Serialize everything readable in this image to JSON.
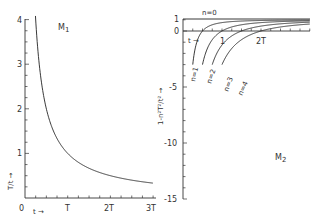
{
  "chart_data": [
    {
      "type": "line",
      "panel_label": "M₁",
      "ylabel": "T/t →",
      "xlabel": "t →",
      "x_ticks": [
        "0",
        "T",
        "2T",
        "3T"
      ],
      "y_ticks": [
        "1",
        "2",
        "3",
        "4"
      ],
      "xlim": [
        0,
        3
      ],
      "ylim": [
        0,
        4
      ],
      "grid": false,
      "series": [
        {
          "name": "T/t",
          "x_unit": "T",
          "x": [
            0.25,
            0.3,
            0.4,
            0.5,
            0.75,
            1.0,
            1.5,
            2.0,
            2.5,
            3.0
          ],
          "values": [
            4.0,
            3.33,
            2.5,
            2.0,
            1.33,
            1.0,
            0.67,
            0.5,
            0.4,
            0.33
          ]
        }
      ]
    },
    {
      "type": "line",
      "panel_label": "M₂",
      "ylabel": "1 - n²T²/t² →",
      "xlabel": "t →",
      "x_ticks": [
        "1",
        "2T"
      ],
      "y_ticks": [
        "1",
        "0",
        "-5",
        "-10",
        "-15"
      ],
      "xlim": [
        0,
        3.5
      ],
      "ylim": [
        -15,
        1
      ],
      "grid": false,
      "series": [
        {
          "name": "n=0",
          "label": "n=0",
          "formula": "1"
        },
        {
          "name": "n=1",
          "label": "n=1",
          "formula": "1 - 1/t²"
        },
        {
          "name": "n=2",
          "label": "n=2",
          "formula": "1 - 4/t²"
        },
        {
          "name": "n=3",
          "label": "n=3",
          "formula": "1 - 9/t²"
        },
        {
          "name": "n=4",
          "label": "n=4",
          "formula": "1 - 16/t²"
        }
      ]
    }
  ],
  "labels": {
    "m1": "M",
    "m1_sub": "1",
    "m2": "M",
    "m2_sub": "2",
    "m1_ylabel": "T/t →",
    "m1_xlabel": "t →",
    "m2_ylabel": "1-n²T²/t² →",
    "m2_xlabel": "t →",
    "m1_x0": "0",
    "m1_x1": "T",
    "m1_x2": "2T",
    "m1_x3": "3T",
    "m1_y1": "1",
    "m1_y2": "2",
    "m1_y3": "3",
    "m1_y4": "4",
    "m2_y1": "1",
    "m2_y0": "0",
    "m2_y5": "-5",
    "m2_y10": "-10",
    "m2_y15": "-15",
    "m2_x1": "1",
    "m2_x2": "2T",
    "n0": "n=0",
    "n1": "n=1",
    "n2": "n=2",
    "n3": "n=3",
    "n4": "n=4"
  }
}
